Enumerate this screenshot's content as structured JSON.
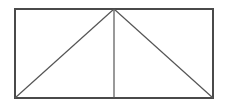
{
  "canvas": {
    "width": 225,
    "height": 107,
    "background": "#ffffff"
  },
  "figure": {
    "name": "rectangle-with-two-diagonals-and-midline",
    "stroke_color_outline": "#4a4a4a",
    "stroke_color_inner": "#555555",
    "stroke_width_outline": 2,
    "stroke_width_inner": 1,
    "fill": "none"
  },
  "geometry": {
    "points": {
      "top_left": {
        "x": 15,
        "y": 9
      },
      "top_mid": {
        "x": 114,
        "y": 9
      },
      "top_right": {
        "x": 213,
        "y": 9
      },
      "bottom_left": {
        "x": 15,
        "y": 98
      },
      "bottom_mid": {
        "x": 114,
        "y": 98
      },
      "bottom_right": {
        "x": 213,
        "y": 98
      }
    },
    "rectangle": {
      "x": 15,
      "y": 9,
      "width": 198,
      "height": 89
    },
    "segments": [
      {
        "name": "outer-rectangle",
        "path": "M 15 9 L 213 9 L 213 98 L 15 98 Z"
      },
      {
        "name": "vertical-midline",
        "path": "M 114 9 L 114 98"
      },
      {
        "name": "diagonal-left",
        "path": "M 114 9 L 15 98"
      },
      {
        "name": "diagonal-right",
        "path": "M 114 9 L 213 98"
      }
    ],
    "regions": [
      {
        "name": "triangle-outer-left",
        "vertices": "top-left, top-mid, bottom-left"
      },
      {
        "name": "triangle-inner-left",
        "vertices": "top-mid, bottom-mid, bottom-left"
      },
      {
        "name": "triangle-inner-right",
        "vertices": "top-mid, bottom-mid, bottom-right"
      },
      {
        "name": "triangle-outer-right",
        "vertices": "top-mid, top-right, bottom-right"
      }
    ]
  }
}
